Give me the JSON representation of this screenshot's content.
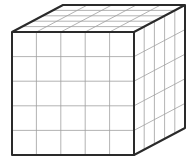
{
  "figure": {
    "partial_label": ")",
    "grid_divisions": 5,
    "colors": {
      "edge": "#2a2a2a",
      "grid": "#9a9a9a",
      "face": "#ffffff"
    }
  }
}
